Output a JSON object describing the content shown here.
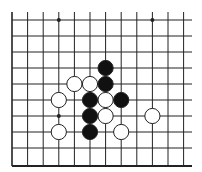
{
  "diagram": {
    "type": "go-board-fragment",
    "grid": {
      "columns_x": [
        12,
        27.6,
        43.2,
        58.8,
        74.4,
        90,
        105.6,
        121.2,
        136.8,
        152.4,
        168,
        183.6
      ],
      "rows_y": [
        20,
        36,
        52,
        68,
        84,
        100,
        116,
        132,
        148
      ],
      "top_edge_y": 12,
      "bottom_border_y": 166,
      "left_border_x": 12,
      "right_extent_x": 192,
      "line_color": "#222222"
    },
    "star_points": [
      {
        "col": 3,
        "row": 0
      },
      {
        "col": 9,
        "row": 0
      },
      {
        "col": 3,
        "row": 6
      }
    ],
    "stones": [
      {
        "color": "black",
        "col": 6,
        "row": 3
      },
      {
        "color": "black",
        "col": 6,
        "row": 4
      },
      {
        "color": "white",
        "col": 4,
        "row": 4
      },
      {
        "color": "white",
        "col": 5,
        "row": 4
      },
      {
        "color": "white",
        "col": 3,
        "row": 5
      },
      {
        "color": "black",
        "col": 5,
        "row": 5
      },
      {
        "color": "white",
        "col": 6,
        "row": 5
      },
      {
        "color": "black",
        "col": 7,
        "row": 5
      },
      {
        "color": "black",
        "col": 5,
        "row": 6
      },
      {
        "color": "white",
        "col": 6,
        "row": 6
      },
      {
        "color": "white",
        "col": 9,
        "row": 6
      },
      {
        "color": "white",
        "col": 3,
        "row": 7
      },
      {
        "color": "black",
        "col": 5,
        "row": 7
      },
      {
        "color": "white",
        "col": 7,
        "row": 7
      }
    ],
    "colors": {
      "black_stone": "#111111",
      "white_stone": "#ffffff",
      "stone_outline": "#222222",
      "background": "#ffffff"
    },
    "stone_radius": 7.6
  }
}
